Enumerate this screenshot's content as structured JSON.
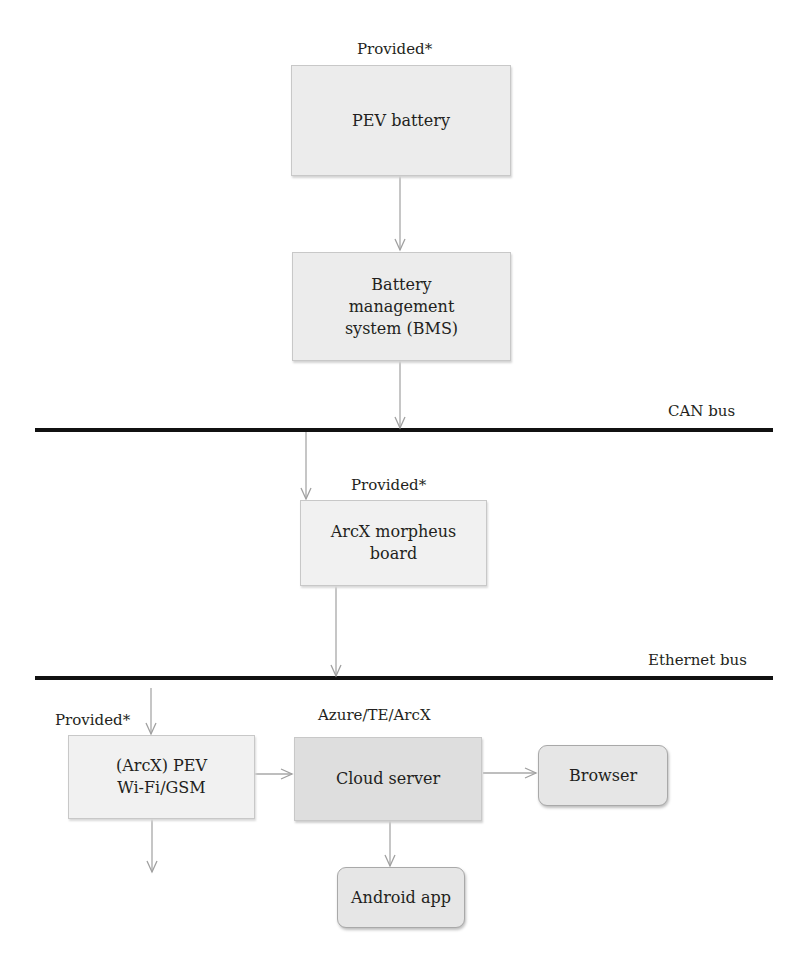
{
  "diagram": {
    "nodes": {
      "pev_battery": {
        "label": "PEV battery",
        "annotation": "Provided*"
      },
      "bms": {
        "label": "Battery management system (BMS)",
        "line1": "Battery",
        "line2": "management",
        "line3": "system (BMS)"
      },
      "morpheus": {
        "label": "ArcX morpheus board",
        "line1": "ArcX morpheus",
        "line2": "board",
        "annotation": "Provided*"
      },
      "wifi_gsm": {
        "label": "(ArcX) PEV Wi-Fi/GSM",
        "line1": "(ArcX) PEV",
        "line2": "Wi-Fi/GSM",
        "annotation": "Provided*"
      },
      "cloud": {
        "label": "Cloud server",
        "annotation": "Azure/TE/ArcX"
      },
      "browser": {
        "label": "Browser"
      },
      "android": {
        "label": "Android app"
      }
    },
    "buses": {
      "can": {
        "label": "CAN bus"
      },
      "ethernet": {
        "label": "Ethernet bus"
      }
    },
    "edges": [
      {
        "from": "pev_battery",
        "to": "bms"
      },
      {
        "from": "bms",
        "to": "can"
      },
      {
        "from": "can",
        "to": "morpheus"
      },
      {
        "from": "morpheus",
        "to": "ethernet"
      },
      {
        "from": "ethernet",
        "to": "wifi_gsm"
      },
      {
        "from": "wifi_gsm",
        "to": "cloud"
      },
      {
        "from": "cloud",
        "to": "browser"
      },
      {
        "from": "cloud",
        "to": "android"
      },
      {
        "from": "wifi_gsm",
        "to": "(out)"
      }
    ],
    "colors": {
      "bus_line": "#111111",
      "arrow": "#a8a8a8",
      "box_fill": "#e6e6e6"
    }
  }
}
